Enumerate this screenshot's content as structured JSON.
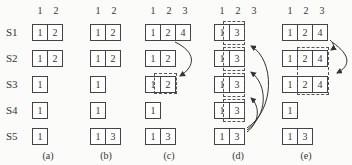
{
  "rows": [
    "S1",
    "S2",
    "S3",
    "S4",
    "S5"
  ],
  "panels": [
    {
      "caption": "(a)",
      "headers": [
        "1",
        "2"
      ],
      "cells": [
        [
          "1",
          "2"
        ],
        [
          "1",
          "2"
        ],
        [
          "1"
        ],
        [
          "1"
        ],
        [
          "1"
        ]
      ]
    },
    {
      "caption": "(b)",
      "headers": [
        "1",
        "2"
      ],
      "cells": [
        [
          "1",
          "2"
        ],
        [
          "1",
          "2"
        ],
        [
          "1"
        ],
        [
          "1"
        ],
        [
          "1",
          "3"
        ]
      ]
    },
    {
      "caption": "(c)",
      "headers": [
        "1",
        "2",
        "3"
      ],
      "cells": [
        [
          "1",
          "2",
          "4"
        ],
        [
          "1",
          "2"
        ],
        [
          "1",
          "2"
        ],
        [
          "1"
        ],
        [
          "1",
          "3"
        ]
      ]
    },
    {
      "caption": "(d)",
      "headers": [
        "1",
        "2",
        "3"
      ],
      "cells": [
        [
          "1",
          "3"
        ],
        [
          "1",
          "3"
        ],
        [
          "1",
          "3"
        ],
        [
          "1",
          "3"
        ],
        [
          "1",
          "3"
        ]
      ]
    },
    {
      "caption": "(e)",
      "headers": [
        "1",
        "2",
        "3"
      ],
      "cells": [
        [
          "1",
          "2",
          "4"
        ],
        [
          "1",
          "2",
          "4"
        ],
        [
          "1",
          "2",
          "4"
        ],
        [
          "1"
        ],
        [
          "1",
          "3"
        ]
      ]
    }
  ]
}
